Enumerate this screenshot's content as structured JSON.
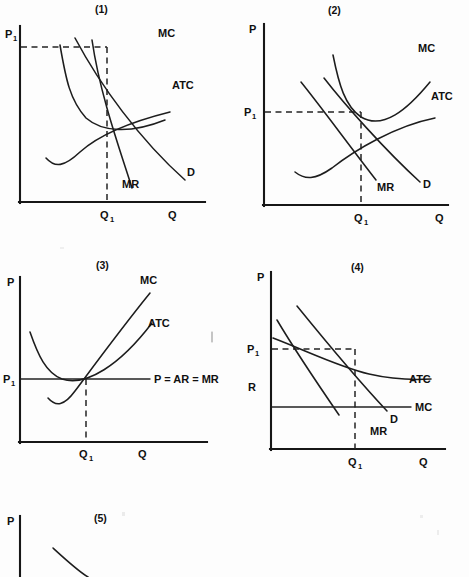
{
  "figure": {
    "type": "economics-cost-curve-diagrams",
    "background_color": "#fdfdfd",
    "ink_color": "#1a1a1a",
    "panel_count": 5
  },
  "panels": [
    {
      "number": "(1)",
      "title": "Monopolistic competition short-run profit",
      "y_axis_label": "P₁",
      "x_axis_label": "Q",
      "quantity_label": "Q₁",
      "curve_labels": {
        "mc": "MC",
        "atc": "ATC",
        "mr": "MR",
        "d": "D"
      },
      "has_price_dashed_line": true,
      "has_quantity_dashed_line": true
    },
    {
      "number": "(2)",
      "title": "Monopolistic competition long-run equilibrium",
      "y_axis_label": "P",
      "price_label": "P₁",
      "x_axis_label": "Q",
      "quantity_label": "Q₁",
      "curve_labels": {
        "mc": "MC",
        "atc": "ATC",
        "mr": "MR",
        "d": "D"
      },
      "has_price_dashed_line": true,
      "has_quantity_dashed_line": true
    },
    {
      "number": "(3)",
      "title": "Perfect competition long-run equilibrium",
      "y_axis_label": "P",
      "price_label": "P₁",
      "x_axis_label": "Q",
      "quantity_label": "Q₁",
      "curve_labels": {
        "mc": "MC",
        "atc": "ATC",
        "demand": "P = AR = MR"
      },
      "has_price_dashed_line": false,
      "has_quantity_dashed_line": true
    },
    {
      "number": "(4)",
      "title": "Natural monopoly",
      "y_axis_label": "P",
      "price_label": "P₁",
      "extra_label": "R",
      "x_axis_label": "Q",
      "quantity_label": "Q₁",
      "curve_labels": {
        "atc": "ATC",
        "mc": "MC",
        "mr": "MR",
        "d": "D"
      },
      "has_price_dashed_line": true,
      "has_quantity_dashed_line": true
    },
    {
      "number": "(5)",
      "title": "Partially visible panel cut off at page bottom",
      "y_axis_label": "P",
      "cropped": true
    }
  ]
}
